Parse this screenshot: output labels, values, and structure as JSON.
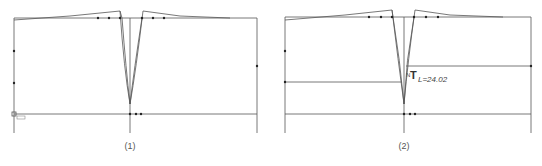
{
  "figure": {
    "panels": [
      {
        "id": "1",
        "caption": "(1)",
        "frame": {
          "x1": 14,
          "x2": 257,
          "top": 18,
          "base": 114,
          "bottom": 133
        },
        "center_x": 130,
        "dart_tip_y": 104,
        "points": [
          [
            14,
            51
          ],
          [
            14,
            83
          ],
          [
            98,
            18
          ],
          [
            109,
            18
          ],
          [
            120,
            18
          ],
          [
            142,
            18
          ],
          [
            153,
            18
          ],
          [
            164,
            18
          ],
          [
            257,
            66
          ],
          [
            130,
            114
          ],
          [
            136,
            114
          ],
          [
            141,
            114
          ]
        ]
      },
      {
        "id": "2",
        "caption": "(2)",
        "frame": {
          "x1": 285,
          "x2": 531,
          "top": 17,
          "base": 114,
          "bottom": 133
        },
        "center_x": 404,
        "dart_tip_y": 104,
        "guide_left_y": 82,
        "guide_right_y": 66,
        "points": [
          [
            285,
            51
          ],
          [
            285,
            82
          ],
          [
            369,
            17
          ],
          [
            381,
            17
          ],
          [
            392,
            17
          ],
          [
            414,
            17
          ],
          [
            426,
            17
          ],
          [
            438,
            17
          ],
          [
            531,
            66
          ],
          [
            404,
            114
          ],
          [
            410,
            114
          ],
          [
            415,
            114
          ]
        ],
        "annotation": {
          "symbol": "T",
          "prefix": "N",
          "label": "L=24.02"
        }
      }
    ],
    "line_color": "#555555",
    "point_color": "#222222"
  }
}
